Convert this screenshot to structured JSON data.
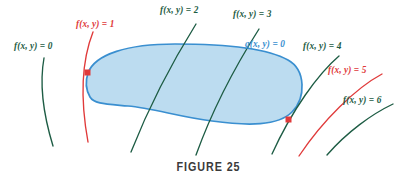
{
  "figure": {
    "caption": "FIGURE 25",
    "colors": {
      "level_curve_green": "#1d5c44",
      "level_curve_red": "#e03a3a",
      "constraint_blue": "#3a8fd0",
      "region_fill": "#bcdcf0",
      "tangent_point": "#e03a3a",
      "caption_gray": "#3a3a3a",
      "background": "#ffffff"
    },
    "labels": [
      {
        "id": "f0",
        "text": "f(x, y) = 0",
        "color": "green",
        "x": 14,
        "y": 42
      },
      {
        "id": "f1",
        "text": "f(x, y) = 1",
        "color": "red",
        "x": 76,
        "y": 20
      },
      {
        "id": "f2",
        "text": "f(x, y) = 2",
        "color": "green",
        "x": 160,
        "y": 6
      },
      {
        "id": "f3",
        "text": "f(x, y) = 3",
        "color": "green",
        "x": 233,
        "y": 10
      },
      {
        "id": "g0",
        "text": "g(x, y) = 0",
        "color": "blue",
        "x": 245,
        "y": 40
      },
      {
        "id": "f4",
        "text": "f(x, y) = 4",
        "color": "green",
        "x": 303,
        "y": 42
      },
      {
        "id": "f5",
        "text": "f(x, y) = 5",
        "color": "red",
        "x": 328,
        "y": 66
      },
      {
        "id": "f6",
        "text": "f(x, y) = 6",
        "color": "green",
        "x": 343,
        "y": 96
      }
    ],
    "tangent_points": [
      {
        "id": "left-tangent-point",
        "x": 88,
        "y": 73
      },
      {
        "id": "right-tangent-point",
        "x": 289,
        "y": 120
      }
    ],
    "curves": {
      "f0": "M 44 58 C 40 80, 42 110, 53 146",
      "f1": "M 93 32 C 82 60, 80 98, 88 142",
      "f2": "M 196 24 C 176 56, 150 104, 131 152",
      "f3": "M 259 29 C 238 62, 213 108, 196 155",
      "f4": "M 339 56 C 318 74, 292 110, 272 154",
      "f5": "M 382 74 C 356 88, 323 120, 299 156",
      "f6": "M 393 104 C 372 114, 347 132, 327 155",
      "blob": "M 88 73 C 95 54, 128 44, 175 44 C 222 44, 265 47, 288 60 C 306 70, 306 98, 292 112 C 278 126, 248 126, 212 121 C 180 117, 152 108, 128 106 C 106 104, 94 104, 90 97 C 86 90, 85 82, 88 73 Z"
    }
  }
}
